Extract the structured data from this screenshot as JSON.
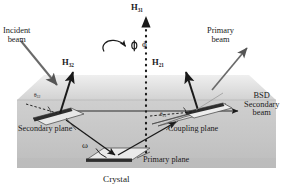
{
  "figure": {
    "caption": "Crystal",
    "background_color": "#ffffff",
    "slab_color": "#c8c8c8",
    "top_face_color": "#dedede",
    "line_color": "#1a1a1a"
  },
  "vectors": {
    "h31": {
      "label": "H",
      "subscript": "31"
    },
    "h32": {
      "label": "H",
      "subscript": "32"
    },
    "h21": {
      "label": "H",
      "subscript": "21"
    }
  },
  "angles": {
    "phi": "ϕ",
    "omega": "ω",
    "theta_left": {
      "symbol": "θ",
      "subscript": "32"
    },
    "theta_right": {
      "symbol": "θ",
      "subscript": "21"
    }
  },
  "beams": {
    "incident": {
      "line1": "Incident",
      "line2": "beam"
    },
    "primary": {
      "line1": "Primary",
      "line2": "beam"
    },
    "bsd_secondary": {
      "line1": "BSD",
      "line2": "Secondary",
      "line3": "beam"
    }
  },
  "planes": {
    "secondary": "Secondary plane",
    "coupling": "Coupling plane",
    "primary": "Primary plane"
  }
}
